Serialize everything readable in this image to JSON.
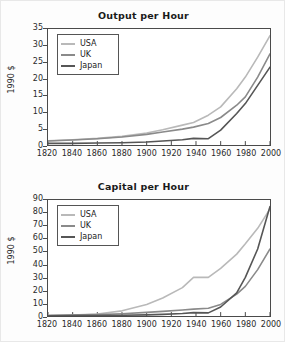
{
  "figure": {
    "background": "#fdfdfd",
    "panels": 2
  },
  "colors": {
    "usa": "#b9b9b9",
    "uk": "#8a8a8a",
    "japan": "#565656",
    "axis": "#4a4a4a",
    "text": "#1a1a1a"
  },
  "legend": {
    "items": [
      {
        "label": "USA",
        "color": "#b9b9b9"
      },
      {
        "label": "UK",
        "color": "#8a8a8a"
      },
      {
        "label": "Japan",
        "color": "#565656"
      }
    ]
  },
  "xticks": [
    "1820",
    "1840",
    "1860",
    "1880",
    "1900",
    "1920",
    "1940",
    "1960",
    "1980",
    "2000"
  ],
  "top": {
    "title": "Output per Hour",
    "ylabel": "1990 $",
    "yticks": [
      "0",
      "5",
      "10",
      "15",
      "20",
      "25",
      "30",
      "35"
    ]
  },
  "bottom": {
    "title": "Capital per Hour",
    "ylabel": "1990 $",
    "yticks": [
      "0",
      "10",
      "20",
      "30",
      "40",
      "50",
      "60",
      "70",
      "80",
      "90"
    ]
  },
  "chart_data": [
    {
      "type": "line",
      "title": "Output per Hour",
      "xlabel": "",
      "ylabel": "1990 $",
      "xlim": [
        1820,
        2000
      ],
      "ylim": [
        0,
        35
      ],
      "ytick_step": 5,
      "xtick_step": 20,
      "grid": false,
      "legend_position": "top-left",
      "x": [
        1820,
        1840,
        1860,
        1880,
        1900,
        1913,
        1929,
        1938,
        1950,
        1960,
        1973,
        1980,
        1990,
        2000
      ],
      "series": [
        {
          "name": "USA",
          "color": "#b9b9b9",
          "values": [
            1.3,
            1.6,
            2.0,
            2.6,
            3.6,
            4.6,
            6.0,
            6.8,
            9.0,
            11.5,
            17.0,
            20.5,
            26.5,
            33.0
          ]
        },
        {
          "name": "UK",
          "color": "#8a8a8a",
          "values": [
            1.2,
            1.5,
            1.9,
            2.4,
            3.2,
            3.9,
            4.8,
            5.4,
            6.5,
            8.3,
            12.0,
            14.5,
            20.5,
            27.5
          ]
        },
        {
          "name": "Japan",
          "color": "#565656",
          "values": [
            0.5,
            0.5,
            0.6,
            0.7,
            0.9,
            1.2,
            1.6,
            2.0,
            1.9,
            4.5,
            9.5,
            12.5,
            18.0,
            23.5
          ]
        }
      ]
    },
    {
      "type": "line",
      "title": "Capital per Hour",
      "xlabel": "",
      "ylabel": "1990 $",
      "xlim": [
        1820,
        2000
      ],
      "ylim": [
        0,
        90
      ],
      "ytick_step": 10,
      "xtick_step": 20,
      "grid": false,
      "legend_position": "top-left",
      "x": [
        1820,
        1840,
        1860,
        1880,
        1900,
        1913,
        1929,
        1938,
        1950,
        1960,
        1973,
        1980,
        1990,
        2000
      ],
      "series": [
        {
          "name": "USA",
          "color": "#b9b9b9",
          "values": [
            0.5,
            0.8,
            1.5,
            4.0,
            9.0,
            14.0,
            22.0,
            30.0,
            30.0,
            37.0,
            48.0,
            56.0,
            68.0,
            83.0
          ]
        },
        {
          "name": "UK",
          "color": "#8a8a8a",
          "values": [
            0.4,
            0.7,
            1.1,
            1.8,
            2.8,
            3.6,
            4.6,
            5.3,
            6.0,
            9.0,
            17.0,
            23.0,
            36.0,
            52.0
          ]
        },
        {
          "name": "Japan",
          "color": "#565656",
          "values": [
            0.2,
            0.3,
            0.4,
            0.6,
            0.9,
            1.3,
            2.0,
            2.6,
            2.4,
            7.0,
            18.0,
            30.0,
            52.0,
            85.0
          ]
        }
      ]
    }
  ]
}
